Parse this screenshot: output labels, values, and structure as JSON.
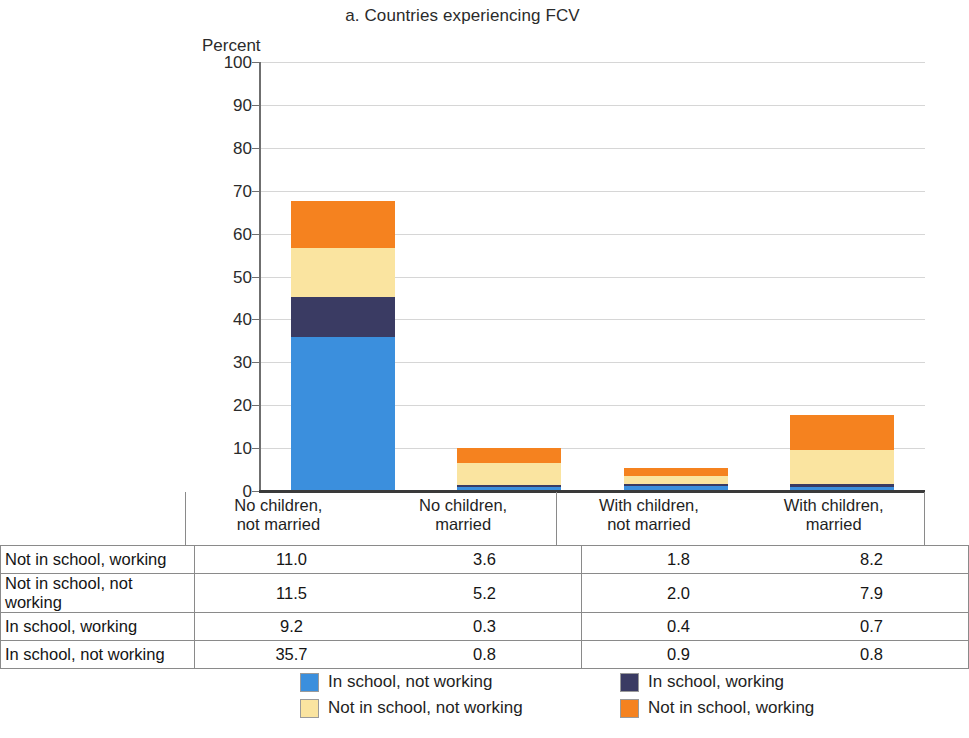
{
  "chart_data": {
    "type": "bar",
    "subtype": "stacked-bar",
    "title": "a. Countries experiencing FCV",
    "xlabel": "",
    "ylabel": "Percent",
    "ylim": [
      0,
      100
    ],
    "yticks": [
      0,
      10,
      20,
      30,
      40,
      50,
      60,
      70,
      80,
      90,
      100
    ],
    "grid": true,
    "legend_position": "bottom",
    "categories": [
      "No children,\nnot married",
      "No children,\nmarried",
      "With children,\nnot married",
      "With children,\nmarried"
    ],
    "series": [
      {
        "name": "In school, not working",
        "color": "#3B8FDD",
        "values": [
          35.7,
          0.8,
          0.9,
          0.8
        ]
      },
      {
        "name": "In school, working",
        "color": "#3A3B63",
        "values": [
          9.2,
          0.3,
          0.4,
          0.7
        ]
      },
      {
        "name": "Not in school, not working",
        "color": "#FAE4A0",
        "values": [
          11.5,
          5.2,
          2.0,
          7.9
        ]
      },
      {
        "name": "Not in school, working",
        "color": "#F5821F",
        "values": [
          11.0,
          3.6,
          1.8,
          8.2
        ]
      }
    ],
    "totals": [
      67.4,
      9.9,
      5.1,
      17.6
    ]
  },
  "axis": {
    "unit_label": "Percent",
    "ticks": [
      "100",
      "90",
      "80",
      "70",
      "60",
      "50",
      "40",
      "30",
      "20",
      "10",
      "0"
    ]
  },
  "categories": [
    {
      "line1": "No children,",
      "line2": "not married"
    },
    {
      "line1": "No children,",
      "line2": "married"
    },
    {
      "line1": "With children,",
      "line2": "not married"
    },
    {
      "line1": "With children,",
      "line2": "married"
    }
  ],
  "table": {
    "rows": [
      {
        "label": "Not in school, working",
        "values": [
          "11.0",
          "3.6",
          "1.8",
          "8.2"
        ]
      },
      {
        "label": "Not in school, not working",
        "values": [
          "11.5",
          "5.2",
          "2.0",
          "7.9"
        ]
      },
      {
        "label": "In school, working",
        "values": [
          "9.2",
          "0.3",
          "0.4",
          "0.7"
        ]
      },
      {
        "label": "In school, not working",
        "values": [
          "35.7",
          "0.8",
          "0.9",
          "0.8"
        ]
      }
    ]
  },
  "legend": {
    "items": [
      {
        "label": "In school, not working",
        "color": "#3B8FDD"
      },
      {
        "label": "In school, working",
        "color": "#3A3B63"
      },
      {
        "label": "Not in school, not working",
        "color": "#FAE4A0"
      },
      {
        "label": "Not in school, working",
        "color": "#F5821F"
      }
    ]
  }
}
